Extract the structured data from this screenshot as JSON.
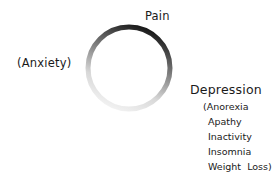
{
  "diagram": {
    "type": "cycle",
    "node_top": "Pain",
    "node_left": "(Anxiety)",
    "node_right": "Depression",
    "depression_symptoms": [
      "(Anorexia",
      "Apathy",
      "Inactivity",
      "Insomnia",
      "Weight  Loss)"
    ],
    "ring_color_dark": "#1a1a1a",
    "ring_color_light": "#f2f2f2"
  }
}
